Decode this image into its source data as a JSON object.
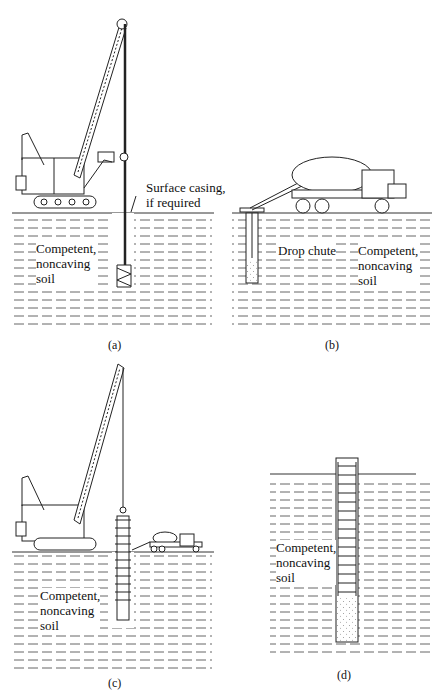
{
  "figure": {
    "panels": [
      {
        "id": "a",
        "caption": "(a)",
        "soil_label": [
          "Competent,",
          "noncaving",
          "soil"
        ],
        "callout": [
          "Surface casing,",
          "if required"
        ],
        "equipment": "crawler crane with auger"
      },
      {
        "id": "b",
        "caption": "(b)",
        "soil_label": [
          "Competent,",
          "noncaving",
          "soil"
        ],
        "callout": [
          "Drop chute"
        ],
        "equipment": "concrete mixer truck"
      },
      {
        "id": "c",
        "caption": "(c)",
        "soil_label": [
          "Competent,",
          "noncaving",
          "soil"
        ],
        "equipment": "crawler crane lowering rebar cage; mixer truck"
      },
      {
        "id": "d",
        "caption": "(d)",
        "soil_label": [
          "Competent,",
          "noncaving",
          "soil"
        ],
        "equipment": "completed drilled shaft"
      }
    ]
  }
}
